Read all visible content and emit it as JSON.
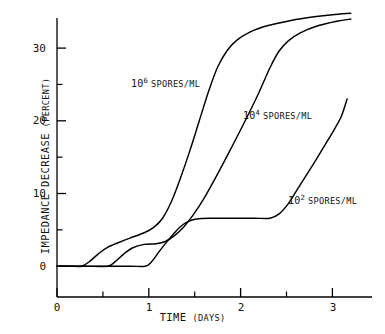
{
  "figure": {
    "background_color": "#ffffff",
    "line_color": "#000000",
    "axis_color": "#000000"
  },
  "axes": {
    "x_title_main": "TIME",
    "x_title_paren": "(DAYS)",
    "y_title_main": "IMPEDANCE DECREASE",
    "y_title_paren": "(PERCENT)",
    "x_tick_labels": [
      "0",
      "1",
      "2",
      "3"
    ],
    "y_tick_labels": [
      "0",
      "10",
      "20",
      "30"
    ]
  },
  "series_labels": {
    "s6": {
      "base": "10",
      "exponent": "6",
      "unit": "SPORES/ML"
    },
    "s4": {
      "base": "10",
      "exponent": "4",
      "unit": "SPORES/ML"
    },
    "s2": {
      "base": "10",
      "exponent": "2",
      "unit": "SPORES/ML"
    }
  },
  "chart_data": {
    "type": "line",
    "title": "",
    "subtitle": "",
    "xlabel": "TIME (DAYS)",
    "ylabel": "IMPEDANCE DECREASE (PERCENT)",
    "xlim": [
      0,
      3.2
    ],
    "ylim": [
      -2,
      35.5
    ],
    "xticks": [
      0,
      1,
      2,
      3
    ],
    "xticks_minor": [
      0.5,
      1.5,
      2.5
    ],
    "yticks": [
      0,
      10,
      20,
      30
    ],
    "yticks_minor": [
      5,
      15,
      25
    ],
    "grid": false,
    "legend_position": "inline-annotations",
    "annotations": [
      {
        "text": "10^6 SPORES/ML",
        "x": 0.99,
        "y": 25.2
      },
      {
        "text": "10^4 SPORES/ML",
        "x": 2.22,
        "y": 20.8
      },
      {
        "text": "10^2 SPORES/ML",
        "x": 2.73,
        "y": 9.9
      }
    ],
    "series": [
      {
        "name": "10^6 spores/mL",
        "points": [
          [
            0.0,
            0.0
          ],
          [
            0.15,
            0.0
          ],
          [
            0.27,
            0.0
          ],
          [
            0.36,
            0.7
          ],
          [
            0.45,
            1.7
          ],
          [
            0.55,
            2.6
          ],
          [
            0.68,
            3.3
          ],
          [
            0.8,
            3.9
          ],
          [
            0.95,
            4.6
          ],
          [
            1.05,
            5.3
          ],
          [
            1.15,
            6.6
          ],
          [
            1.25,
            9.0
          ],
          [
            1.35,
            12.3
          ],
          [
            1.45,
            16.0
          ],
          [
            1.55,
            20.0
          ],
          [
            1.65,
            24.0
          ],
          [
            1.75,
            27.4
          ],
          [
            1.85,
            29.6
          ],
          [
            1.95,
            31.0
          ],
          [
            2.1,
            32.2
          ],
          [
            2.3,
            33.1
          ],
          [
            2.55,
            33.8
          ],
          [
            2.8,
            34.3
          ],
          [
            3.0,
            34.6
          ],
          [
            3.2,
            34.8
          ]
        ]
      },
      {
        "name": "10^4 spores/mL",
        "points": [
          [
            0.0,
            0.0
          ],
          [
            0.3,
            0.0
          ],
          [
            0.55,
            0.0
          ],
          [
            0.63,
            0.6
          ],
          [
            0.72,
            1.6
          ],
          [
            0.82,
            2.5
          ],
          [
            0.95,
            3.0
          ],
          [
            1.08,
            3.1
          ],
          [
            1.18,
            3.4
          ],
          [
            1.28,
            4.2
          ],
          [
            1.38,
            5.4
          ],
          [
            1.48,
            7.0
          ],
          [
            1.6,
            9.3
          ],
          [
            1.75,
            12.7
          ],
          [
            1.9,
            16.3
          ],
          [
            2.05,
            20.0
          ],
          [
            2.2,
            23.9
          ],
          [
            2.32,
            27.3
          ],
          [
            2.42,
            29.6
          ],
          [
            2.52,
            31.0
          ],
          [
            2.65,
            32.1
          ],
          [
            2.85,
            33.1
          ],
          [
            3.05,
            33.7
          ],
          [
            3.2,
            34.0
          ]
        ]
      },
      {
        "name": "10^2 spores/mL",
        "points": [
          [
            0.0,
            0.0
          ],
          [
            0.5,
            0.0
          ],
          [
            0.8,
            0.0
          ],
          [
            0.96,
            0.0
          ],
          [
            1.03,
            0.6
          ],
          [
            1.1,
            1.8
          ],
          [
            1.18,
            3.1
          ],
          [
            1.26,
            4.3
          ],
          [
            1.34,
            5.4
          ],
          [
            1.42,
            6.1
          ],
          [
            1.52,
            6.5
          ],
          [
            1.7,
            6.6
          ],
          [
            1.95,
            6.6
          ],
          [
            2.15,
            6.6
          ],
          [
            2.32,
            6.6
          ],
          [
            2.42,
            7.2
          ],
          [
            2.52,
            8.6
          ],
          [
            2.62,
            10.6
          ],
          [
            2.72,
            12.6
          ],
          [
            2.82,
            14.6
          ],
          [
            2.92,
            16.7
          ],
          [
            3.02,
            18.8
          ],
          [
            3.1,
            20.7
          ],
          [
            3.16,
            23.0
          ]
        ]
      }
    ]
  }
}
